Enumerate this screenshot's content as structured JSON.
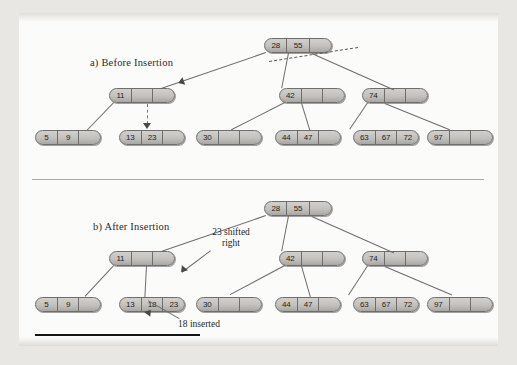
{
  "figure": {
    "kind": "2-3-4 tree insertion diagram",
    "footnote_rule": true
  },
  "panels": [
    {
      "id": "before",
      "title": "a) Before Insertion",
      "root": {
        "cells": [
          "28",
          "55",
          ""
        ]
      },
      "internal": [
        {
          "cells": [
            "11",
            "",
            ""
          ]
        },
        {
          "cells": [
            "42",
            "",
            ""
          ]
        },
        {
          "cells": [
            "74",
            "",
            ""
          ]
        }
      ],
      "leaves": [
        {
          "cells": [
            "5",
            "9",
            ""
          ]
        },
        {
          "cells": [
            "13",
            "23",
            ""
          ]
        },
        {
          "cells": [
            "30",
            "",
            ""
          ]
        },
        {
          "cells": [
            "44",
            "47",
            ""
          ]
        },
        {
          "cells": [
            "63",
            "67",
            "72"
          ]
        },
        {
          "cells": [
            "97",
            "",
            ""
          ]
        }
      ],
      "annotations": []
    },
    {
      "id": "after",
      "title": "b) After Insertion",
      "root": {
        "cells": [
          "28",
          "55",
          ""
        ]
      },
      "internal": [
        {
          "cells": [
            "11",
            "",
            ""
          ]
        },
        {
          "cells": [
            "42",
            "",
            ""
          ]
        },
        {
          "cells": [
            "74",
            "",
            ""
          ]
        }
      ],
      "leaves": [
        {
          "cells": [
            "5",
            "9",
            ""
          ]
        },
        {
          "cells": [
            "13",
            "18",
            "23"
          ]
        },
        {
          "cells": [
            "30",
            "",
            ""
          ]
        },
        {
          "cells": [
            "44",
            "47",
            ""
          ]
        },
        {
          "cells": [
            "63",
            "67",
            "72"
          ]
        },
        {
          "cells": [
            "97",
            "",
            ""
          ]
        }
      ],
      "annotations": [
        {
          "id": "shifted",
          "text": "23 shifted\nright"
        },
        {
          "id": "inserted",
          "text": "18 inserted"
        }
      ]
    }
  ],
  "colors": {
    "node_fill": "#c3c1be",
    "node_border": "#6f6e6c",
    "edge": "#6e6c6a",
    "paper": "#fbfbfa",
    "page_bg": "#e9e7e3",
    "text": "#1d1d1d"
  }
}
